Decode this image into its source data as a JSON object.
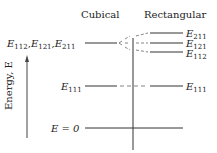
{
  "headers": {
    "cubical": "Cubical",
    "rectangular": "Rectangular"
  },
  "axis": {
    "ylabel": "Energy, E"
  },
  "levels": {
    "cubical_degenerate": {
      "label_parts": [
        {
          "sym": "E",
          "sub": "112"
        },
        {
          "sym": "E",
          "sub": "121"
        },
        {
          "sym": "E",
          "sub": "211"
        }
      ],
      "separator": ","
    },
    "cubical_ground": {
      "sym": "E",
      "sub": "111"
    },
    "zero": {
      "text": "E = 0"
    },
    "rect_split": [
      {
        "sym": "E",
        "sub": "211"
      },
      {
        "sym": "E",
        "sub": "121"
      },
      {
        "sym": "E",
        "sub": "112"
      }
    ],
    "rect_ground": {
      "sym": "E",
      "sub": "111"
    }
  }
}
